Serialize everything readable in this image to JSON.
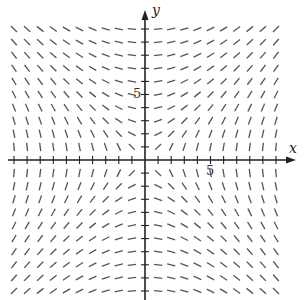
{
  "diagram": {
    "type": "slope_field",
    "equation": "dy/dx = x/y",
    "x_range": [
      -10,
      10
    ],
    "y_range": [
      -10,
      10
    ],
    "grid_step": 1,
    "axis_labels": {
      "x": "x",
      "y": "y"
    },
    "tick_labels": {
      "x": "5",
      "y": "5"
    },
    "colors": {
      "segment": "#555555",
      "axis": "#222222",
      "background": "#ffffff"
    }
  }
}
